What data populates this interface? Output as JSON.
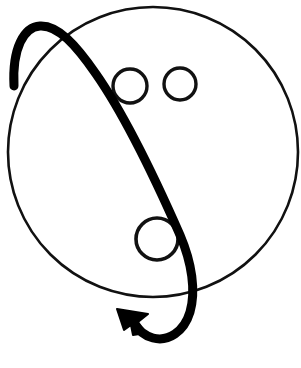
{
  "canvas": {
    "width": 301,
    "height": 368,
    "background_color": "#ffffff",
    "title": "Hand-drawn face with sweeping arrow"
  },
  "colors": {
    "ink": "#0d0d0d",
    "stroke_thin": "#111111",
    "stroke_thick": "#000000",
    "background": "#ffffff"
  },
  "shapes": {
    "head_outline": {
      "name": "large-circle",
      "type": "circle",
      "cx": 153,
      "cy": 152,
      "r": 145,
      "stroke_width": 2.6,
      "fill": "none"
    },
    "eye_left": {
      "name": "small-circle-left",
      "type": "circle",
      "cx": 130,
      "cy": 86,
      "r": 17,
      "stroke_width": 3.4,
      "fill": "none"
    },
    "eye_right": {
      "name": "small-circle-right",
      "type": "circle",
      "cx": 180,
      "cy": 84,
      "r": 16,
      "stroke_width": 3.4,
      "fill": "none"
    },
    "mouth_circle": {
      "name": "medium-circle-lower",
      "type": "circle",
      "cx": 157,
      "cy": 239,
      "r": 21,
      "stroke_width": 3.6,
      "fill": "none"
    },
    "arrow_curve": {
      "name": "thick-swept-arrow",
      "type": "path",
      "stroke_width": 9,
      "path": "M 14 86 C 12 48 24 27 40 26 C 58 25 76 45 96 74 C 126 117 158 185 180 235 C 192 263 196 291 190 312 C 184 332 168 342 153 338 C 145 336 138 330 133 322",
      "fill": "none",
      "linecap": "round"
    },
    "arrow_head": {
      "name": "arrowhead",
      "type": "polygon",
      "points": "117 309 148 314 138 322 146 333 133 335 131 325 124 330",
      "tip_x": 117,
      "tip_y": 309,
      "direction": "upper-left"
    }
  },
  "description": {
    "subject": "face-like line sketch",
    "element_count": 5
  }
}
